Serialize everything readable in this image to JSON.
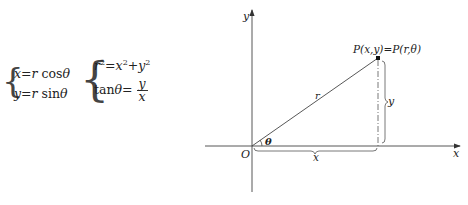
{
  "equations": {
    "system1": {
      "line1": "x = r cosθ",
      "line2": "y = r sinθ",
      "parts": {
        "l1a": "x",
        "l1b": "=",
        "l1c": "r",
        "l1d": "cosθ",
        "l2a": "y",
        "l2b": "=",
        "l2c": "r",
        "l2d": "sinθ"
      }
    },
    "system2": {
      "line1_lhs": "r",
      "line1_exp": "2",
      "line1_mid": "=",
      "line1_x": "x",
      "line1_xexp": "2",
      "line1_plus": "+",
      "line1_y": "y",
      "line1_yexp": "2",
      "line2_lhs": "tanθ =",
      "line2_num": "y",
      "line2_den": "x"
    }
  },
  "diagram": {
    "axis_x_label": "x",
    "axis_y_label": "y",
    "origin_label": "O",
    "radius_label": "r",
    "angle_label": "θ",
    "point_label": "P(x,y)=P(r,θ)",
    "x_dist_label": "x",
    "y_dist_label": "y"
  }
}
